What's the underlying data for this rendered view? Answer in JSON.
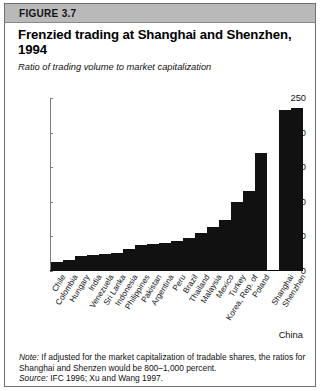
{
  "figure": {
    "label": "FIGURE 3.7",
    "title": "Frenzied trading at Shanghai and Shenzhen, 1994",
    "subtitle": "Ratio of trading volume to market capitalization",
    "note_lead": "Note:",
    "note_text": " If adjusted for the market capitalization of tradable shares, the ratios for Shanghai and Shenzen would be 800–1,000 percent.",
    "source_lead": "Source:",
    "source_text": " IFC 1996; Xu and Wang 1997."
  },
  "colors": {
    "bar": "#111111",
    "header_band": "#b9b9b9",
    "border": "#6f6f6f",
    "axis": "#7d7d7d"
  },
  "chart_data": {
    "type": "bar",
    "title": "Frenzied trading at Shanghai and Shenzhen, 1994",
    "subtitle": "Ratio of trading volume to market capitalization",
    "xlabel": "",
    "ylabel": "",
    "ylim": [
      0,
      250
    ],
    "yticks": [
      0,
      50,
      100,
      150,
      200,
      250
    ],
    "grid": false,
    "legend": false,
    "group_label": "China",
    "group_label_members": [
      "Shanghai",
      "Shenzhen"
    ],
    "categories": [
      "Chile",
      "Colombia",
      "Hungary",
      "India",
      "Venezuela",
      "Sri Lanka",
      "Indonesia",
      "Philippines",
      "Pakistan",
      "Argentina",
      "Peru",
      "Brazil",
      "Thailand",
      "Malaysia",
      "Mexico",
      "Turkey",
      "Korea, Rep. of",
      "Poland",
      "Shanghai",
      "Shenzhen"
    ],
    "values": [
      13,
      16,
      21,
      23,
      24,
      26,
      32,
      37,
      39,
      41,
      43,
      47,
      55,
      63,
      74,
      100,
      115,
      170,
      232,
      236
    ],
    "gap_before_index": 18
  }
}
